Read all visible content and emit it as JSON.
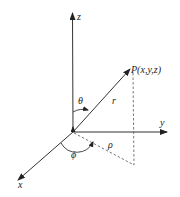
{
  "diagram": {
    "type": "spherical-coordinates",
    "colors": {
      "stroke": "#333333",
      "background": "#ffffff"
    },
    "axes": {
      "z": {
        "label": "z"
      },
      "y": {
        "label": "y"
      },
      "x": {
        "label": "x"
      }
    },
    "point": {
      "label": "P(x,y,z)"
    },
    "vector": {
      "label": "r"
    },
    "angles": {
      "polar": {
        "label": "θ"
      },
      "azimuth": {
        "label": "ϕ"
      }
    },
    "projection": {
      "label": "ρ"
    }
  }
}
